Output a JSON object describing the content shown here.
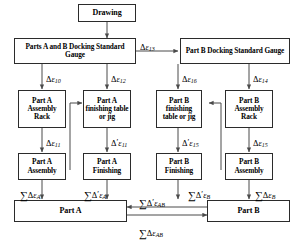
{
  "diagram": {
    "boxes": {
      "drawing": "Drawing",
      "ab_docking_gauge": "Parts A and B Docking Standard Gauge",
      "b_docking_gauge": "Part B Docking Standard Gauge",
      "a_assembly_rack": "Part A Assembly Rack",
      "a_finishing_table": "Part A finishing table or jig",
      "b_finishing_table": "Part B finishing table or jig",
      "b_assembly_rack": "Part B Assembly Rack",
      "a_assembly": "Part A Assembly",
      "a_finishing": "Part A Finishing",
      "b_finishing": "Part B Finishing",
      "b_assembly": "Part B Assembly",
      "part_a": "Part A",
      "part_b": "Part B"
    },
    "edge_labels": {
      "e13": {
        "delta": "Δ",
        "prime": "",
        "eps": "ε",
        "sub": "13"
      },
      "e10": {
        "delta": "Δ",
        "prime": "",
        "eps": "ε",
        "sub": "10"
      },
      "e12": {
        "delta": "Δ",
        "prime": "",
        "eps": "ε",
        "sub": "12"
      },
      "e16": {
        "delta": "Δ",
        "prime": "",
        "eps": "ε",
        "sub": "16"
      },
      "e14": {
        "delta": "Δ",
        "prime": "",
        "eps": "ε",
        "sub": "14"
      },
      "e11": {
        "delta": "Δ",
        "prime": "",
        "eps": "ε",
        "sub": "11"
      },
      "e11p": {
        "delta": "Δ",
        "prime": "′",
        "eps": "ε",
        "sub": "11"
      },
      "e15p": {
        "delta": "Δ",
        "prime": "′",
        "eps": "ε",
        "sub": "15"
      },
      "e15": {
        "delta": "Δ",
        "prime": "",
        "eps": "ε",
        "sub": "15"
      }
    },
    "sum_labels": {
      "sum_a": {
        "sigma": "∑",
        "delta": "Δ",
        "prime": "",
        "eps": "ε",
        "sub": "A"
      },
      "sum_a_prime": {
        "sigma": "∑",
        "delta": "Δ",
        "prime": "′",
        "eps": "ε",
        "sub": "A"
      },
      "sum_b_prime": {
        "sigma": "∑",
        "delta": "Δ",
        "prime": "′",
        "eps": "ε",
        "sub": "B"
      },
      "sum_b": {
        "sigma": "∑",
        "delta": "Δ",
        "prime": "",
        "eps": "ε",
        "sub": "B"
      },
      "sum_ab_prime": {
        "sigma": "∑",
        "delta": "Δ",
        "prime": "′",
        "eps": "ε",
        "sub": "AB"
      },
      "sum_ab": {
        "sigma": "∑",
        "delta": "Δ",
        "prime": "",
        "eps": "ε",
        "sub": "AB"
      }
    },
    "colors": {
      "line": "#4a4a4a",
      "border": "#2b2b2b",
      "text": "#000000",
      "background": "#ffffff"
    }
  }
}
